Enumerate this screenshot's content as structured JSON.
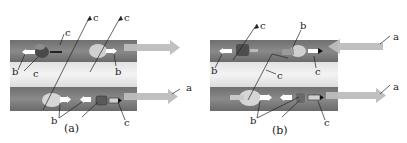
{
  "figure": {
    "panels": [
      {
        "id": "a",
        "caption": "(a)",
        "labels": {
          "a": "a",
          "b": "b",
          "c": "c"
        },
        "arrow_direction": [
          "right",
          "right"
        ]
      },
      {
        "id": "b",
        "caption": "(b)",
        "labels": {
          "a": "a",
          "b": "b",
          "c": "c"
        },
        "arrow_direction": [
          "left",
          "right"
        ]
      }
    ],
    "legend_letters": [
      "a",
      "b",
      "c"
    ],
    "colors": {
      "dark_band": "#7a7a7a",
      "light_band": "#ececec",
      "arrow": "#bdbdbd",
      "particle_dark": "#4a4a4a",
      "particle_light": "#d8d8d8",
      "marker_white": "#ffffff",
      "leader_line": "#222222"
    }
  }
}
